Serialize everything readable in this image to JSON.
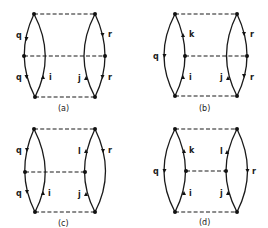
{
  "figure": {
    "colors": {
      "line": "#1a1a1a",
      "background": "#ffffff"
    },
    "panels": [
      {
        "id": "a",
        "caption": "(a)",
        "left_lens": {
          "outer_labels": [
            {
              "text": "q",
              "dir": "down"
            },
            {
              "text": "q",
              "dir": "down"
            }
          ],
          "inner_labels": [
            {
              "text": "i",
              "dir": "up"
            }
          ],
          "middle_node_side": "outer"
        },
        "right_lens": {
          "outer_labels": [
            {
              "text": "r",
              "dir": "down"
            },
            {
              "text": "r",
              "dir": "down"
            }
          ],
          "inner_labels": [
            {
              "text": "j",
              "dir": "up"
            }
          ],
          "middle_node_side": "outer"
        }
      },
      {
        "id": "b",
        "caption": "(b)",
        "left_lens": {
          "outer_labels": [
            {
              "text": "q",
              "dir": "down"
            }
          ],
          "inner_labels": [
            {
              "text": "k",
              "dir": "up"
            },
            {
              "text": "i",
              "dir": "up"
            }
          ],
          "middle_node_side": "inner"
        },
        "right_lens": {
          "outer_labels": [
            {
              "text": "r",
              "dir": "down"
            },
            {
              "text": "r",
              "dir": "down"
            }
          ],
          "inner_labels": [
            {
              "text": "j",
              "dir": "up"
            }
          ],
          "middle_node_side": "outer"
        }
      },
      {
        "id": "c",
        "caption": "(c)",
        "left_lens": {
          "outer_labels": [
            {
              "text": "q",
              "dir": "down"
            },
            {
              "text": "q",
              "dir": "down"
            }
          ],
          "inner_labels": [
            {
              "text": "i",
              "dir": "up"
            }
          ],
          "middle_node_side": "outer"
        },
        "right_lens": {
          "outer_labels": [
            {
              "text": "r",
              "dir": "down"
            }
          ],
          "inner_labels": [
            {
              "text": "l",
              "dir": "up"
            },
            {
              "text": "j",
              "dir": "up"
            }
          ],
          "middle_node_side": "inner"
        }
      },
      {
        "id": "d",
        "caption": "(d)",
        "left_lens": {
          "outer_labels": [
            {
              "text": "q",
              "dir": "down"
            }
          ],
          "inner_labels": [
            {
              "text": "k",
              "dir": "up"
            },
            {
              "text": "i",
              "dir": "up"
            }
          ],
          "middle_node_side": "inner"
        },
        "right_lens": {
          "outer_labels": [
            {
              "text": "r",
              "dir": "down"
            }
          ],
          "inner_labels": [
            {
              "text": "l",
              "dir": "up"
            },
            {
              "text": "j",
              "dir": "up"
            }
          ],
          "middle_node_side": "inner"
        }
      }
    ]
  }
}
